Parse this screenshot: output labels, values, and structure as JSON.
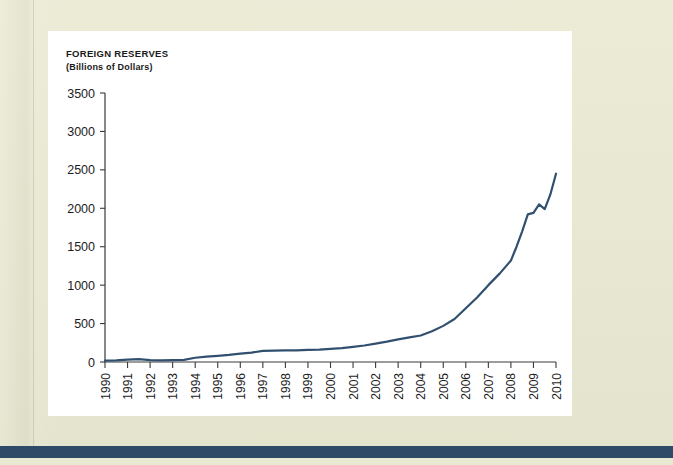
{
  "page": {
    "background_color": "#e9e9d2",
    "card_background": "#ffffff",
    "accent_bar_color": "#2f4a68"
  },
  "chart_data": {
    "type": "line",
    "title": "Foreign Reserves",
    "subtitle": "(Billions of Dollars)",
    "xlabel": "Year",
    "ylabel": "",
    "line_color": "#31506f",
    "grid": false,
    "legend": "none",
    "xlim": [
      1990,
      2010
    ],
    "ylim": [
      0,
      3500
    ],
    "ytick_labels": [
      "3500",
      "3000",
      "2500",
      "2000",
      "1500",
      "1000",
      "500",
      "0"
    ],
    "yticks": [
      3500,
      3000,
      2500,
      2000,
      1500,
      1000,
      500,
      0
    ],
    "xtick_labels": [
      "1990",
      "1991",
      "1992",
      "1993",
      "1994",
      "1995",
      "1996",
      "1997",
      "1998",
      "1999",
      "2000",
      "2001",
      "2002",
      "2003",
      "2004",
      "2005",
      "2006",
      "2007",
      "2008",
      "2009",
      "2010"
    ],
    "x": [
      1990,
      1990.5,
      1991,
      1991.5,
      1992,
      1992.5,
      1993,
      1993.5,
      1994,
      1994.5,
      1995,
      1995.5,
      1996,
      1996.5,
      1997,
      1997.5,
      1998,
      1998.5,
      1999,
      1999.5,
      2000,
      2000.5,
      2001,
      2001.5,
      2002,
      2002.5,
      2003,
      2003.5,
      2004,
      2004.5,
      2005,
      2005.5,
      2006,
      2006.5,
      2007,
      2007.5,
      2008,
      2008.25,
      2008.5,
      2008.75,
      2009,
      2009.25,
      2009.5,
      2009.75,
      2010
    ],
    "values": [
      18,
      22,
      30,
      38,
      25,
      22,
      24,
      28,
      55,
      70,
      80,
      92,
      108,
      122,
      145,
      148,
      150,
      152,
      158,
      162,
      170,
      180,
      196,
      215,
      240,
      265,
      295,
      320,
      345,
      400,
      470,
      560,
      700,
      840,
      1000,
      1150,
      1320,
      1500,
      1700,
      1920,
      1940,
      2050,
      1990,
      2180,
      2450
    ],
    "series_name": "Foreign reserves",
    "annotations": []
  }
}
